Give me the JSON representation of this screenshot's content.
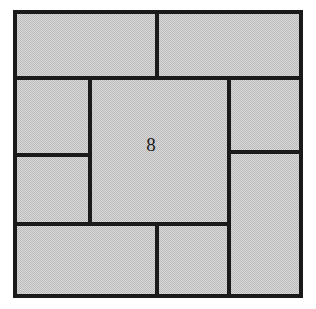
{
  "figure": {
    "outer_square": {
      "name": "outer-boundary",
      "x": 15,
      "y": 12,
      "width": 286,
      "height": 284
    },
    "colors": {
      "fill": "#c9c9c9",
      "fill_dither_light": "#dcdcdc",
      "fill_dither_dark": "#b2b2b2",
      "stroke": "#1a1a1a",
      "background": "#ffffff"
    },
    "stroke_width_outer": 4,
    "stroke_width_inner": 3.5,
    "tiles": [
      {
        "id": "top-left",
        "name": "tile-top-left",
        "x": 15,
        "y": 12,
        "width": 142,
        "height": 66,
        "label": ""
      },
      {
        "id": "top-right",
        "name": "tile-top-right",
        "x": 157,
        "y": 12,
        "width": 144,
        "height": 66,
        "label": ""
      },
      {
        "id": "left-upper",
        "name": "tile-left-upper",
        "x": 15,
        "y": 78,
        "width": 75,
        "height": 77,
        "label": ""
      },
      {
        "id": "left-lower",
        "name": "tile-left-lower",
        "x": 15,
        "y": 155,
        "width": 75,
        "height": 69,
        "label": ""
      },
      {
        "id": "center",
        "name": "tile-center",
        "x": 90,
        "y": 78,
        "width": 139,
        "height": 146,
        "label": "8"
      },
      {
        "id": "right-upper",
        "name": "tile-right-upper",
        "x": 229,
        "y": 78,
        "width": 72,
        "height": 74,
        "label": ""
      },
      {
        "id": "right-lower",
        "name": "tile-right-lower",
        "x": 229,
        "y": 152,
        "width": 72,
        "height": 144,
        "label": ""
      },
      {
        "id": "bottom-left",
        "name": "tile-bottom-left",
        "x": 15,
        "y": 224,
        "width": 142,
        "height": 72,
        "label": ""
      },
      {
        "id": "bottom-middle",
        "name": "tile-bottom-middle",
        "x": 157,
        "y": 224,
        "width": 72,
        "height": 72,
        "label": ""
      }
    ],
    "labels": [
      {
        "name": "center-tile-number",
        "text": "8",
        "x": 151,
        "y": 147
      }
    ]
  }
}
